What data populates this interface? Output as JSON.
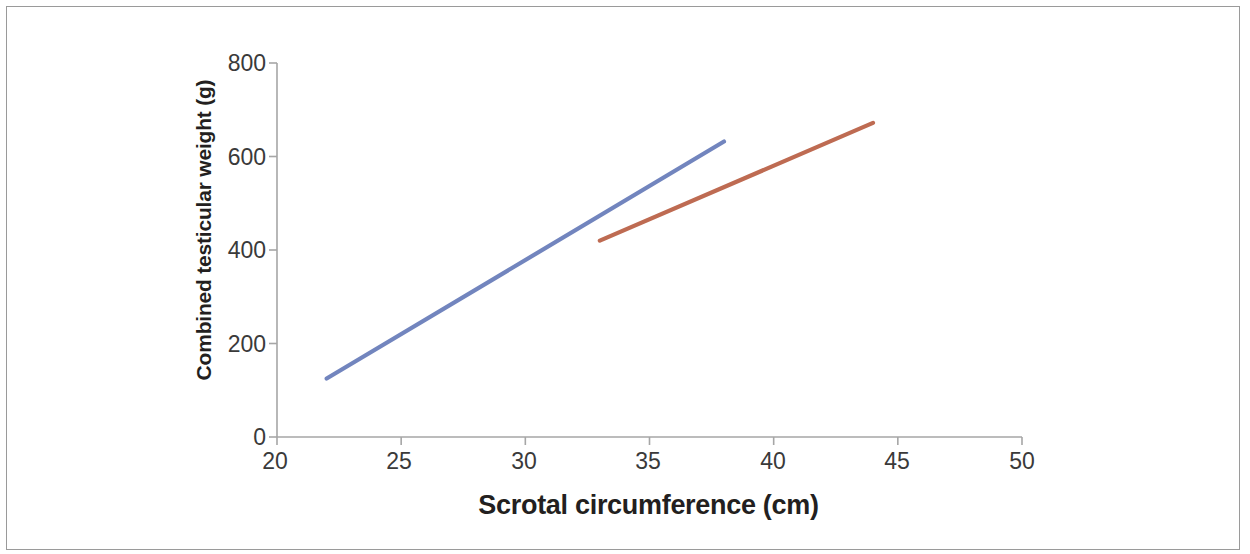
{
  "chart_data": {
    "type": "line",
    "title": "",
    "xlabel": "Scrotal circumference (cm)",
    "ylabel": "Combined testicular weight (g)",
    "xlim": [
      20,
      50
    ],
    "ylim": [
      0,
      800
    ],
    "xticks": [
      20,
      25,
      30,
      35,
      40,
      45,
      50
    ],
    "yticks": [
      0,
      200,
      400,
      600,
      800
    ],
    "grid": false,
    "legend": "none",
    "series": [
      {
        "name": "series-1",
        "color": "#7285BE",
        "x": [
          22,
          38
        ],
        "y": [
          125,
          632
        ]
      },
      {
        "name": "series-2",
        "color": "#BE6B52",
        "x": [
          33,
          44
        ],
        "y": [
          420,
          672
        ]
      }
    ]
  },
  "axes": {
    "x_title": "Scrotal circumference (cm)",
    "y_title": "Combined testicular weight (g)",
    "x_tick_labels": [
      "20",
      "25",
      "30",
      "35",
      "40",
      "45",
      "50"
    ],
    "y_tick_labels": [
      "800",
      "600",
      "400",
      "200",
      "0"
    ]
  },
  "colors": {
    "series_1": "#7285BE",
    "series_2": "#BE6B52",
    "axis": "#a6a6a6",
    "text": "#3a3a3a",
    "frame": "#9a9a9a"
  }
}
